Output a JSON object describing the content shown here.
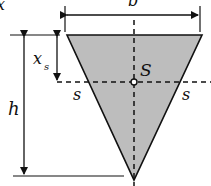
{
  "diagram": {
    "labels": {
      "width": "b",
      "height": "h",
      "centroid_offset": "x",
      "centroid_offset_sub": "s",
      "centroid": "S",
      "axis_left": "s",
      "axis_right": "s",
      "corner_partial": "x"
    },
    "colors": {
      "fill": "#bdbdbd",
      "stroke": "#111111",
      "background": "#ffffff"
    }
  }
}
